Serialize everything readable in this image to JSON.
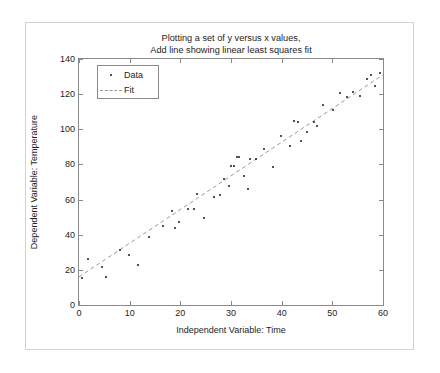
{
  "chart_data": {
    "type": "scatter",
    "title": "Plotting a set of y versus x values,\nAdd line showing linear least squares fit",
    "title_lines": [
      "Plotting a set of y versus x values,",
      "Add line showing linear least squares fit"
    ],
    "xlabel": "Independent Variable: Time",
    "ylabel": "Dependent Variable: Temperature",
    "xlim": [
      0,
      60
    ],
    "ylim": [
      0,
      140
    ],
    "xticks": [
      0,
      10,
      20,
      30,
      40,
      50,
      60
    ],
    "yticks": [
      0,
      20,
      40,
      60,
      80,
      100,
      120,
      140
    ],
    "xtick_labels": [
      "0",
      "10",
      "20",
      "30",
      "40",
      "50",
      "60"
    ],
    "ytick_labels": [
      "0",
      "20",
      "40",
      "60",
      "80",
      "100",
      "120",
      "140"
    ],
    "grid": false,
    "box": true,
    "tick_direction": "in",
    "legend": {
      "position": "top-left-inside",
      "entries": [
        {
          "label": "Data",
          "marker": "dot",
          "style": "scatter",
          "color": "#1a1a1a"
        },
        {
          "label": "Fit",
          "marker": "line",
          "style": "dashed",
          "color": "#9a9a9a"
        }
      ]
    },
    "series": [
      {
        "name": "Data",
        "type": "scatter",
        "marker": "dot",
        "color": "#1a1a1a",
        "points": [
          [
            0.6,
            15.5
          ],
          [
            1.8,
            26.0
          ],
          [
            4.6,
            21.5
          ],
          [
            5.4,
            15.8
          ],
          [
            8.0,
            31.5
          ],
          [
            9.8,
            28.5
          ],
          [
            11.6,
            23.0
          ],
          [
            13.8,
            38.5
          ],
          [
            16.6,
            45.0
          ],
          [
            18.4,
            53.5
          ],
          [
            19.0,
            44.0
          ],
          [
            19.8,
            47.0
          ],
          [
            21.6,
            54.5
          ],
          [
            22.6,
            54.5
          ],
          [
            23.2,
            63.0
          ],
          [
            24.6,
            49.5
          ],
          [
            26.6,
            61.5
          ],
          [
            27.8,
            62.5
          ],
          [
            28.6,
            71.5
          ],
          [
            29.6,
            67.5
          ],
          [
            30.0,
            79.0
          ],
          [
            30.6,
            79.0
          ],
          [
            31.2,
            84.5
          ],
          [
            31.6,
            84.5
          ],
          [
            32.6,
            73.5
          ],
          [
            33.4,
            66.0
          ],
          [
            33.8,
            83.0
          ],
          [
            35.0,
            83.0
          ],
          [
            36.6,
            88.5
          ],
          [
            38.2,
            78.5
          ],
          [
            39.8,
            96.0
          ],
          [
            41.6,
            90.5
          ],
          [
            42.4,
            104.5
          ],
          [
            43.2,
            104.0
          ],
          [
            43.8,
            93.5
          ],
          [
            45.0,
            98.5
          ],
          [
            46.4,
            104.0
          ],
          [
            47.0,
            102.0
          ],
          [
            48.2,
            114.0
          ],
          [
            50.2,
            111.0
          ],
          [
            51.6,
            120.5
          ],
          [
            52.8,
            118.5
          ],
          [
            54.0,
            121.0
          ],
          [
            55.4,
            119.0
          ],
          [
            56.8,
            128.5
          ],
          [
            57.6,
            131.0
          ],
          [
            58.4,
            124.5
          ],
          [
            59.4,
            132.0
          ]
        ]
      },
      {
        "name": "Fit",
        "type": "line",
        "style": "dashed",
        "color": "#9a9a9a",
        "endpoints": [
          [
            0,
            16.0
          ],
          [
            60,
            131.0
          ]
        ],
        "equation": "y = 16.0 + 1.917x"
      }
    ]
  }
}
